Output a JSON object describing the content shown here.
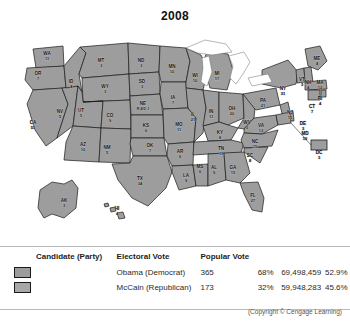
{
  "title": "2008",
  "colors": {
    "democrat_swatch": "#9d9d9d",
    "republican_swatch": "#a8a8a8",
    "state_fill": "#9d9d9d",
    "state_border": "#1a1a1a",
    "water": "#ffffff"
  },
  "map": {
    "name": "united-states-electoral-map-2008",
    "states": [
      {
        "code": "WA",
        "votes": "11",
        "party": "dem",
        "x": 47,
        "y": 33
      },
      {
        "code": "OR",
        "votes": "7",
        "party": "dem",
        "x": 38,
        "y": 53
      },
      {
        "code": "CA",
        "votes": "55",
        "party": "dem",
        "x": 33,
        "y": 102
      },
      {
        "code": "NV",
        "votes": "5",
        "party": "dem",
        "x": 60,
        "y": 91
      },
      {
        "code": "ID",
        "votes": "4",
        "party": "rep",
        "x": 71,
        "y": 61
      },
      {
        "code": "MT",
        "votes": "3",
        "party": "rep",
        "x": 101,
        "y": 40
      },
      {
        "code": "WY",
        "votes": "3",
        "party": "rep",
        "x": 105,
        "y": 66
      },
      {
        "code": "UT",
        "votes": "5",
        "party": "rep",
        "x": 81,
        "y": 90
      },
      {
        "code": "AZ",
        "votes": "10",
        "party": "rep",
        "x": 83,
        "y": 124
      },
      {
        "code": "CO",
        "votes": "9",
        "party": "dem",
        "x": 110,
        "y": 95
      },
      {
        "code": "NM",
        "votes": "5",
        "party": "dem",
        "x": 107,
        "y": 127
      },
      {
        "code": "ND",
        "votes": "3",
        "party": "rep",
        "x": 141,
        "y": 40
      },
      {
        "code": "SD",
        "votes": "3",
        "party": "rep",
        "x": 142,
        "y": 61
      },
      {
        "code": "NE",
        "votes": "R-4/D-1",
        "party": "rep",
        "x": 143,
        "y": 83
      },
      {
        "code": "KS",
        "votes": "6",
        "party": "rep",
        "x": 146,
        "y": 105
      },
      {
        "code": "OK",
        "votes": "7",
        "party": "rep",
        "x": 150,
        "y": 125
      },
      {
        "code": "TX",
        "votes": "34",
        "party": "rep",
        "x": 140,
        "y": 158
      },
      {
        "code": "MN",
        "votes": "10",
        "party": "dem",
        "x": 172,
        "y": 46
      },
      {
        "code": "IA",
        "votes": "7",
        "party": "dem",
        "x": 173,
        "y": 77
      },
      {
        "code": "MO",
        "votes": "11",
        "party": "rep",
        "x": 179,
        "y": 104
      },
      {
        "code": "AR",
        "votes": "6",
        "party": "rep",
        "x": 180,
        "y": 131
      },
      {
        "code": "LA",
        "votes": "9",
        "party": "rep",
        "x": 186,
        "y": 155
      },
      {
        "code": "WI",
        "votes": "10",
        "party": "dem",
        "x": 195,
        "y": 55
      },
      {
        "code": "IL",
        "votes": "21",
        "party": "dem",
        "x": 193,
        "y": 94
      },
      {
        "code": "MS",
        "votes": "6",
        "party": "rep",
        "x": 200,
        "y": 146
      },
      {
        "code": "MI",
        "votes": "17",
        "party": "dem",
        "x": 217,
        "y": 53
      },
      {
        "code": "IN",
        "votes": "11",
        "party": "dem",
        "x": 211,
        "y": 91
      },
      {
        "code": "KY",
        "votes": "8",
        "party": "rep",
        "x": 220,
        "y": 112
      },
      {
        "code": "TN",
        "votes": "11",
        "party": "rep",
        "x": 221,
        "y": 128
      },
      {
        "code": "AL",
        "votes": "9",
        "party": "rep",
        "x": 214,
        "y": 147
      },
      {
        "code": "OH",
        "votes": "20",
        "party": "dem",
        "x": 232,
        "y": 88
      },
      {
        "code": "GA",
        "votes": "15",
        "party": "rep",
        "x": 233,
        "y": 147
      },
      {
        "code": "FL",
        "votes": "27",
        "party": "dem",
        "x": 253,
        "y": 175
      },
      {
        "code": "WV",
        "votes": "5",
        "party": "rep",
        "x": 247,
        "y": 102
      },
      {
        "code": "SC",
        "votes": "8",
        "party": "rep",
        "x": 250,
        "y": 135
      },
      {
        "code": "NC",
        "votes": "15",
        "party": "dem",
        "x": 255,
        "y": 121
      },
      {
        "code": "VA",
        "votes": "13",
        "party": "dem",
        "x": 261,
        "y": 105
      },
      {
        "code": "PA",
        "votes": "21",
        "party": "dem",
        "x": 263,
        "y": 80
      },
      {
        "code": "NY",
        "votes": "31",
        "party": "dem",
        "x": 283,
        "y": 68
      },
      {
        "code": "ME",
        "votes": "4",
        "party": "dem",
        "x": 317,
        "y": 38
      },
      {
        "code": "VT",
        "votes": "3",
        "party": "dem",
        "x": 302,
        "y": 59
      },
      {
        "code": "NH",
        "votes": "4",
        "party": "dem",
        "x": 308,
        "y": 62
      },
      {
        "code": "MA",
        "votes": "12",
        "party": "dem",
        "x": 320,
        "y": 62
      },
      {
        "code": "RI",
        "votes": "4",
        "party": "dem",
        "x": 320,
        "y": 78
      },
      {
        "code": "CT",
        "votes": "7",
        "party": "dem",
        "x": 312,
        "y": 86
      },
      {
        "code": "NJ",
        "votes": "15",
        "party": "dem",
        "x": 290,
        "y": 92
      },
      {
        "code": "DE",
        "votes": "3",
        "party": "dem",
        "x": 303,
        "y": 103
      },
      {
        "code": "MD",
        "votes": "10",
        "party": "dem",
        "x": 305,
        "y": 113
      },
      {
        "code": "DC",
        "votes": "3",
        "party": "dem",
        "x": 319,
        "y": 132
      },
      {
        "code": "AK",
        "votes": "3",
        "party": "rep",
        "x": 64,
        "y": 180
      },
      {
        "code": "HI",
        "votes": "4",
        "party": "dem",
        "x": 117,
        "y": 188
      }
    ]
  },
  "legend": {
    "headers": {
      "candidate": "Candidate (Party)",
      "electoral": "Electoral Vote",
      "popular": "Popular Vote"
    },
    "rows": [
      {
        "candidate": "Obama (Democrat)",
        "electoral_votes": "365",
        "electoral_pct": "68%",
        "popular_votes": "69,498,459",
        "popular_pct": "52.9%",
        "swatch": "#9d9d9d"
      },
      {
        "candidate": "McCain (Republican)",
        "electoral_votes": "173",
        "electoral_pct": "32%",
        "popular_votes": "59,948,283",
        "popular_pct": "45.6%",
        "swatch": "#a8a8a8"
      }
    ]
  },
  "copyright": "(Copyright © Cengage Learning)"
}
